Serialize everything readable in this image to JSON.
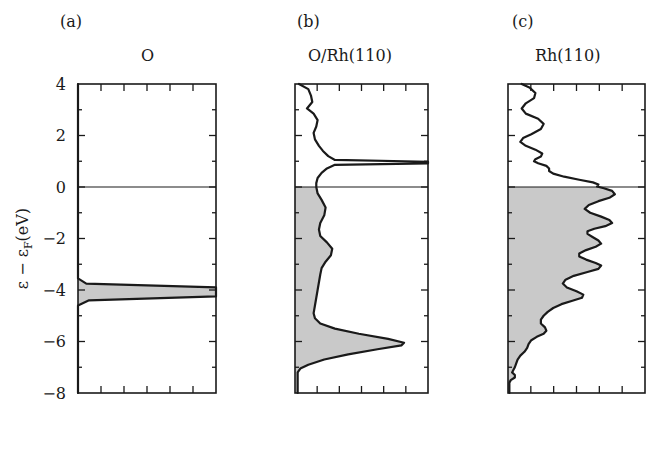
{
  "figure": {
    "axis_label_y": "ε − ε",
    "axis_label_y_sub": "F",
    "axis_label_y_tail": "(eV)",
    "y_ticks": [
      "4",
      "2",
      "0",
      "−2",
      "−4",
      "−6",
      "−8"
    ],
    "fill_color": "#c9c9c9",
    "line_color": "#1a1a1a",
    "panels": [
      {
        "tag": "(a)",
        "title": "O"
      },
      {
        "tag": "(b)",
        "title": "O/Rh(110)"
      },
      {
        "tag": "(c)",
        "title": "Rh(110)"
      }
    ]
  },
  "chart_data": {
    "type": "area",
    "xlabel": "DOS (arb. units)",
    "ylabel": "ε − ε_F (eV)",
    "ylim": [
      -8,
      4
    ],
    "y_ticks_major": [
      4,
      2,
      0,
      -2,
      -4,
      -6,
      -8
    ],
    "y_ticks_minor": [
      3,
      1,
      -1,
      -3,
      -5,
      -7
    ],
    "x_ticks_minor_count": 5,
    "grid": false,
    "legend": "none",
    "orientation": "horizontal-dos-vertical-energy",
    "fermi_level": 0,
    "shading_note": "states below the Fermi level (ε − ε_F < 0) are filled light gray",
    "panels": [
      {
        "tag": "(a)",
        "title": "O",
        "description": "Free O atom: single very narrow 2p resonance at about -4 eV, clipped at the right frame edge; zero DOS elsewhere.",
        "xlim": [
          0,
          1
        ],
        "series": [
          {
            "name": "O 2p",
            "points_energy_dos": [
              [
                4.0,
                0.0
              ],
              [
                -3.55,
                0.0
              ],
              [
                -3.75,
                0.06
              ],
              [
                -3.9,
                1.0
              ],
              [
                -4.25,
                1.0
              ],
              [
                -4.4,
                0.08
              ],
              [
                -4.6,
                0.0
              ],
              [
                -8.0,
                0.0
              ]
            ]
          }
        ],
        "peaks": [
          {
            "energy": -4.05,
            "dos": 1.0,
            "label": "O 2p atomic level"
          }
        ]
      },
      {
        "tag": "(b)",
        "title": "O/Rh(110)",
        "description": "Oxygen projected DOS on Rh(110): weak structure above E_F, a sharp antibonding spike at about +0.95 eV clipped at the right edge, broad low intensity between 0 and -5 eV, and a strong bonding peak at about -6.1 eV.",
        "xlim": [
          0,
          1
        ],
        "series": [
          {
            "name": "O 2p projected",
            "points_energy_dos": [
              [
                4.0,
                0.03
              ],
              [
                3.8,
                0.1
              ],
              [
                3.55,
                0.12
              ],
              [
                3.3,
                0.13
              ],
              [
                3.05,
                0.09
              ],
              [
                2.85,
                0.14
              ],
              [
                2.6,
                0.17
              ],
              [
                2.35,
                0.16
              ],
              [
                2.1,
                0.14
              ],
              [
                1.85,
                0.15
              ],
              [
                1.6,
                0.18
              ],
              [
                1.4,
                0.21
              ],
              [
                1.2,
                0.25
              ],
              [
                1.05,
                0.3
              ],
              [
                0.98,
                1.0
              ],
              [
                0.92,
                1.0
              ],
              [
                0.86,
                0.3
              ],
              [
                0.72,
                0.24
              ],
              [
                0.55,
                0.2
              ],
              [
                0.35,
                0.17
              ],
              [
                0.15,
                0.16
              ],
              [
                0.0,
                0.16
              ],
              [
                -0.25,
                0.17
              ],
              [
                -0.5,
                0.2
              ],
              [
                -0.8,
                0.23
              ],
              [
                -1.1,
                0.22
              ],
              [
                -1.4,
                0.19
              ],
              [
                -1.65,
                0.18
              ],
              [
                -1.9,
                0.19
              ],
              [
                -2.15,
                0.24
              ],
              [
                -2.4,
                0.28
              ],
              [
                -2.65,
                0.27
              ],
              [
                -2.9,
                0.23
              ],
              [
                -3.15,
                0.2
              ],
              [
                -3.4,
                0.19
              ],
              [
                -3.7,
                0.18
              ],
              [
                -4.0,
                0.17
              ],
              [
                -4.3,
                0.16
              ],
              [
                -4.6,
                0.15
              ],
              [
                -4.9,
                0.14
              ],
              [
                -5.1,
                0.15
              ],
              [
                -5.3,
                0.19
              ],
              [
                -5.5,
                0.3
              ],
              [
                -5.7,
                0.48
              ],
              [
                -5.9,
                0.7
              ],
              [
                -6.05,
                0.82
              ],
              [
                -6.15,
                0.8
              ],
              [
                -6.3,
                0.62
              ],
              [
                -6.5,
                0.4
              ],
              [
                -6.7,
                0.22
              ],
              [
                -6.9,
                0.1
              ],
              [
                -7.05,
                0.04
              ],
              [
                -7.2,
                0.02
              ],
              [
                -7.4,
                0.02
              ],
              [
                -8.0,
                0.02
              ]
            ]
          }
        ],
        "peaks": [
          {
            "energy": 0.95,
            "dos": 1.0,
            "label": "antibonding spike (clipped)"
          },
          {
            "energy": -6.1,
            "dos": 0.82,
            "label": "O 2p - Rh d bonding peak"
          },
          {
            "energy": -2.5,
            "dos": 0.28,
            "label": "shoulder"
          }
        ]
      },
      {
        "tag": "(c)",
        "title": "Rh(110)",
        "description": "Clean Rh(110) d-band: oscillating low DOS above E_F, a step rise just below +1 eV, and a multi-peak filled d-band between 0 and -6.5 eV with maxima near -0.2, -1.2, -2.2, -3.0 and -4.2 eV, falling to near zero below -7 eV.",
        "xlim": [
          0,
          1
        ],
        "series": [
          {
            "name": "Rh 4d projected",
            "points_energy_dos": [
              [
                4.0,
                0.1
              ],
              [
                3.85,
                0.16
              ],
              [
                3.65,
                0.2
              ],
              [
                3.45,
                0.19
              ],
              [
                3.25,
                0.13
              ],
              [
                3.05,
                0.1
              ],
              [
                2.85,
                0.13
              ],
              [
                2.65,
                0.22
              ],
              [
                2.45,
                0.26
              ],
              [
                2.25,
                0.24
              ],
              [
                2.05,
                0.17
              ],
              [
                1.9,
                0.11
              ],
              [
                1.75,
                0.09
              ],
              [
                1.6,
                0.13
              ],
              [
                1.45,
                0.2
              ],
              [
                1.3,
                0.25
              ],
              [
                1.18,
                0.24
              ],
              [
                1.08,
                0.2
              ],
              [
                1.0,
                0.19
              ],
              [
                0.92,
                0.22
              ],
              [
                0.82,
                0.28
              ],
              [
                0.72,
                0.3
              ],
              [
                0.62,
                0.3
              ],
              [
                0.52,
                0.33
              ],
              [
                0.4,
                0.41
              ],
              [
                0.28,
                0.52
              ],
              [
                0.18,
                0.62
              ],
              [
                0.1,
                0.66
              ],
              [
                0.02,
                0.65
              ],
              [
                -0.05,
                0.7
              ],
              [
                -0.15,
                0.76
              ],
              [
                -0.28,
                0.78
              ],
              [
                -0.42,
                0.74
              ],
              [
                -0.55,
                0.66
              ],
              [
                -0.7,
                0.59
              ],
              [
                -0.85,
                0.56
              ],
              [
                -1.0,
                0.6
              ],
              [
                -1.15,
                0.68
              ],
              [
                -1.28,
                0.74
              ],
              [
                -1.4,
                0.76
              ],
              [
                -1.52,
                0.71
              ],
              [
                -1.62,
                0.63
              ],
              [
                -1.72,
                0.58
              ],
              [
                -1.82,
                0.58
              ],
              [
                -1.95,
                0.62
              ],
              [
                -2.08,
                0.66
              ],
              [
                -2.2,
                0.68
              ],
              [
                -2.32,
                0.64
              ],
              [
                -2.45,
                0.57
              ],
              [
                -2.58,
                0.52
              ],
              [
                -2.7,
                0.52
              ],
              [
                -2.82,
                0.57
              ],
              [
                -2.95,
                0.64
              ],
              [
                -3.05,
                0.68
              ],
              [
                -3.18,
                0.66
              ],
              [
                -3.3,
                0.58
              ],
              [
                -3.45,
                0.48
              ],
              [
                -3.6,
                0.42
              ],
              [
                -3.75,
                0.4
              ],
              [
                -3.9,
                0.43
              ],
              [
                -4.05,
                0.5
              ],
              [
                -4.18,
                0.55
              ],
              [
                -4.3,
                0.54
              ],
              [
                -4.42,
                0.47
              ],
              [
                -4.55,
                0.39
              ],
              [
                -4.7,
                0.33
              ],
              [
                -4.85,
                0.29
              ],
              [
                -5.0,
                0.26
              ],
              [
                -5.15,
                0.24
              ],
              [
                -5.3,
                0.24
              ],
              [
                -5.45,
                0.27
              ],
              [
                -5.58,
                0.28
              ],
              [
                -5.7,
                0.26
              ],
              [
                -5.82,
                0.21
              ],
              [
                -5.95,
                0.17
              ],
              [
                -6.1,
                0.15
              ],
              [
                -6.25,
                0.14
              ],
              [
                -6.4,
                0.12
              ],
              [
                -6.55,
                0.09
              ],
              [
                -6.7,
                0.07
              ],
              [
                -6.85,
                0.06
              ],
              [
                -7.0,
                0.05
              ],
              [
                -7.1,
                0.04
              ],
              [
                -7.2,
                0.03
              ],
              [
                -7.3,
                0.05
              ],
              [
                -7.4,
                0.05
              ],
              [
                -7.5,
                0.02
              ],
              [
                -7.6,
                0.01
              ],
              [
                -8.0,
                0.01
              ]
            ]
          }
        ],
        "peaks": [
          {
            "energy": -0.25,
            "dos": 0.78,
            "label": "d-band peak near E_F"
          },
          {
            "energy": -1.35,
            "dos": 0.76,
            "label": "d-band peak"
          },
          {
            "energy": -2.2,
            "dos": 0.68,
            "label": "d-band peak"
          },
          {
            "energy": -3.05,
            "dos": 0.68,
            "label": "d-band peak"
          },
          {
            "energy": -4.18,
            "dos": 0.55,
            "label": "d-band peak"
          },
          {
            "energy": -5.5,
            "dos": 0.28,
            "label": "d-band tail shoulder"
          }
        ]
      }
    ]
  }
}
